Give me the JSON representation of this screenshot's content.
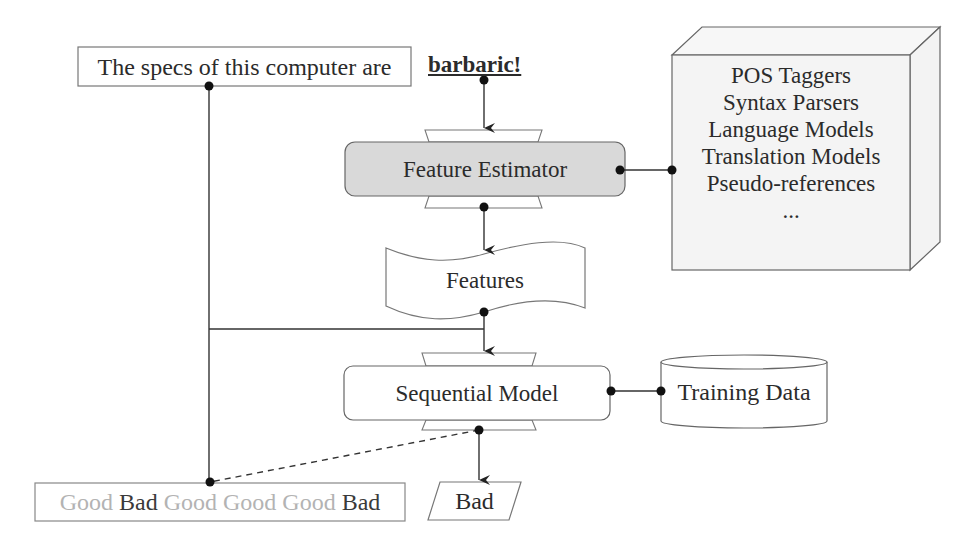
{
  "diagram": {
    "type": "word-level quality estimation pipeline",
    "input": {
      "source_sentence": "The specs of this computer are",
      "target_word": "barbaric!"
    },
    "feature_estimator": {
      "label": "Feature Estimator",
      "fill_color": "#d9d9d9"
    },
    "resources": {
      "items": [
        "POS Taggers",
        "Syntax Parsers",
        "Language Models",
        "Translation Models",
        "Pseudo-references",
        "..."
      ],
      "fill_color": "#f4f4f4"
    },
    "features": {
      "label": "Features"
    },
    "sequential_model": {
      "label": "Sequential Model",
      "fill_color": "#ffffff"
    },
    "training_data": {
      "label": "Training Data"
    },
    "label_sequence": {
      "tokens": [
        {
          "text": "Good",
          "style": "faded",
          "color": "#b3b3b3"
        },
        {
          "text": "Bad",
          "style": "dark",
          "color": "#3a3a3a"
        },
        {
          "text": "Good",
          "style": "faded",
          "color": "#b3b3b3"
        },
        {
          "text": "Good",
          "style": "faded",
          "color": "#b3b3b3"
        },
        {
          "text": "Good",
          "style": "faded",
          "color": "#b3b3b3"
        },
        {
          "text": "Bad",
          "style": "dark",
          "color": "#3a3a3a"
        }
      ]
    },
    "output": {
      "label": "Bad"
    },
    "colors": {
      "stroke": "#555555",
      "arrow": "#222222",
      "text": "#2b2b2b"
    }
  }
}
